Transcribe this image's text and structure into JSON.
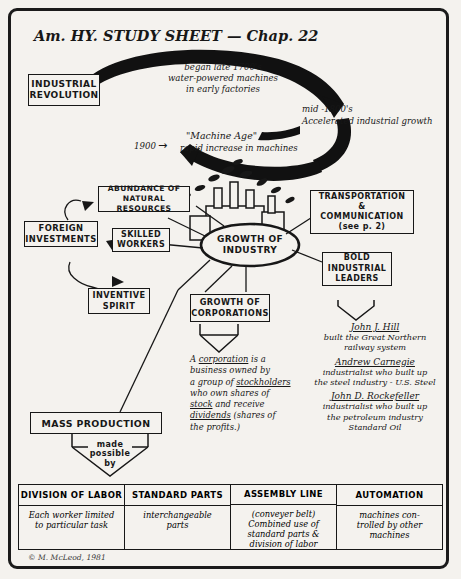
{
  "sheet": {
    "title": "Am. HY. STUDY SHEET — Chap. 22",
    "credit": "© M. McLeod, 1981"
  },
  "cycle": {
    "source_box": "INDUSTRIAL\nREVOLUTION",
    "stage1": "began late 1700's\nwater-powered machines\nin early factories",
    "stage2": "mid -1800's\nAccelerated industrial growth",
    "stage3_year": "1900",
    "stage3_arrow": "→",
    "stage3_title": "\"Machine Age\"",
    "stage3_text": "rapid increase in machines"
  },
  "center": {
    "hub": "GROWTH OF\nINDUSTRY"
  },
  "causes": [
    {
      "label": "ABUNDANCE OF\nNATURAL RESOURCES"
    },
    {
      "label": "FOREIGN\nINVESTMENTS"
    },
    {
      "label": "SKILLED\nWORKERS"
    },
    {
      "label": "INVENTIVE\nSPIRIT"
    }
  ],
  "effects": {
    "transportation": "TRANSPORTATION\n&\nCOMMUNICATION\n(see p. 2)",
    "leaders_box": "BOLD\nINDUSTRIAL\nLEADERS",
    "corporations_box": "GROWTH OF\nCORPORATIONS",
    "mass_production_box": "MASS PRODUCTION",
    "made_possible_by": "made\npossible\nby"
  },
  "corporation_def": {
    "l1_a": "A ",
    "l1_u": "corporation",
    "l1_b": " is a",
    "l2": "business owned by",
    "l3_a": "a group of ",
    "l3_u": "stockholders",
    "l4_a": "who own shares of",
    "l5_u": "stock",
    "l5_b": " and receive",
    "l6_u": "dividends",
    "l6_b": " (shares of",
    "l7": "the profits.)"
  },
  "leaders": [
    {
      "name": "John J. Hill",
      "desc": "built the Great Northern\nrailway system"
    },
    {
      "name": "Andrew Carnegie",
      "desc": "industrialist who built up\nthe steel industry - U.S. Steel"
    },
    {
      "name": "John D. Rockefeller",
      "desc": "industrialist who built up\nthe petroleum industry\nStandard Oil"
    }
  ],
  "table": {
    "headers": [
      "DIVISION OF LABOR",
      "STANDARD PARTS",
      "ASSEMBLY LINE",
      "AUTOMATION"
    ],
    "cells": [
      "Each worker limited\nto particular task",
      "interchangeable\nparts",
      "(conveyer belt)\nCombined use of\nstandard parts &\ndivision of labor",
      "machines con-\ntrolled by other\nmachines"
    ]
  }
}
